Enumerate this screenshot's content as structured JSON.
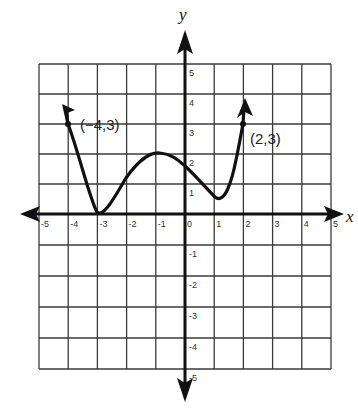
{
  "chart_data": {
    "type": "line",
    "title": "",
    "xlabel": "x",
    "ylabel": "y",
    "xlim": [
      -5,
      5
    ],
    "ylim": [
      -5,
      5
    ],
    "grid": true,
    "x_ticks": [
      "-5",
      "-4",
      "-3",
      "-2",
      "-1",
      "0",
      "1",
      "2",
      "3",
      "4",
      "5"
    ],
    "y_ticks": [
      "5",
      "4",
      "3",
      "2",
      "1",
      "-1",
      "-2",
      "-3",
      "-4",
      "-5"
    ],
    "series": [
      {
        "name": "f(x)",
        "points": [
          {
            "x": -4.2,
            "y": 3.6
          },
          {
            "x": -4,
            "y": 3
          },
          {
            "x": -3,
            "y": 0
          },
          {
            "x": -2,
            "y": 1.3
          },
          {
            "x": -1,
            "y": 2
          },
          {
            "x": 0,
            "y": 1.5
          },
          {
            "x": 1,
            "y": 0.5
          },
          {
            "x": 2,
            "y": 3
          },
          {
            "x": 2.1,
            "y": 3.8
          }
        ],
        "end_behavior": "arrows at both ends pointing upward"
      }
    ],
    "annotations": [
      {
        "label": "(-4,3)",
        "x": -4,
        "y": 3
      },
      {
        "label": "(2,3)",
        "x": 2,
        "y": 3
      }
    ]
  },
  "labels": {
    "x_axis": "x",
    "y_axis": "y",
    "point_left": "(−4,3)",
    "point_right": "(2,3)"
  }
}
